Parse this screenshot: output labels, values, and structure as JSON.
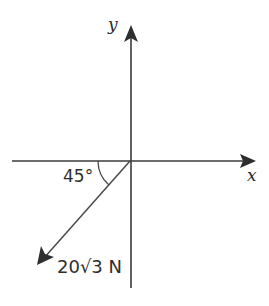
{
  "figure": {
    "type": "vector-diagram",
    "background_color": "#ffffff",
    "stroke_color": "#3b3b3b",
    "text_color": "#2e2e2e",
    "origin": {
      "x": 130,
      "y": 161
    },
    "axes": {
      "x": {
        "label": "x",
        "start": {
          "x": 12,
          "y": 161
        },
        "end": {
          "x": 256,
          "y": 161
        },
        "label_position": {
          "x": 249,
          "y": 180
        },
        "arrow": "right"
      },
      "y": {
        "label": "y",
        "start": {
          "x": 131,
          "y": 288
        },
        "end": {
          "x": 131,
          "y": 25
        },
        "label_position": {
          "x": 109,
          "y": 30
        },
        "arrow": "up"
      }
    },
    "vector": {
      "magnitude_label": "20√3 N",
      "magnitude_value": 20,
      "magnitude_radical": "3",
      "unit": "N",
      "angle_label": "45°",
      "angle_value": 45,
      "angle_reference": "negative x-axis",
      "direction": "down-left",
      "tail": {
        "x": 130,
        "y": 161
      },
      "tip": {
        "x": 37,
        "y": 265
      },
      "label_position": {
        "x": 58,
        "y": 270
      },
      "arrow": "tip-at-end"
    },
    "angle_arc": {
      "label": "45°",
      "radius": 32,
      "start_angle_deg": 180,
      "end_angle_deg": 228,
      "label_position": {
        "x": 64,
        "y": 181
      }
    }
  }
}
